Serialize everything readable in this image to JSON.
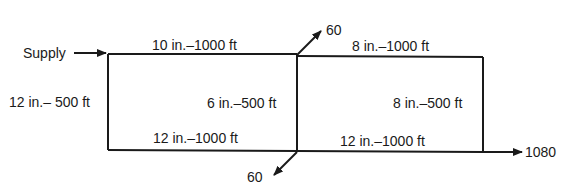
{
  "diagram": {
    "type": "pipe-network",
    "inflow": {
      "label": "Supply"
    },
    "pipes": {
      "top_left": "10 in.–1000 ft",
      "top_right": "8 in.–1000 ft",
      "left": "12 in.– 500 ft",
      "middle": "6 in.–500 ft",
      "right": "8 in.–500 ft",
      "bottom_left": "12 in.–1000 ft",
      "bottom_right": "12 in.–1000 ft"
    },
    "outflows": {
      "top_middle": "60",
      "bottom_middle": "60",
      "bottom_right": "1080"
    },
    "colors": {
      "line": "#1a1a1a",
      "background": "#ffffff"
    }
  }
}
